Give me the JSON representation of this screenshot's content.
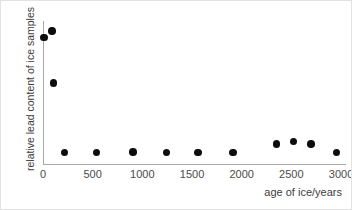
{
  "chart_data": {
    "type": "scatter",
    "title": "",
    "xlabel": "age of ice/years",
    "ylabel": "relative lead content of ice samples",
    "xlim": [
      0,
      3050
    ],
    "ylim": [
      0,
      1.05
    ],
    "grid": false,
    "legend": null,
    "xticks": [
      0,
      500,
      1000,
      1500,
      2000,
      2500,
      3000
    ],
    "xticklabels": [
      "0",
      "500",
      "1000",
      "1500",
      "2000",
      "2500",
      "3000"
    ],
    "yticks": [],
    "yticklabels": [],
    "x": [
      10,
      90,
      105,
      215,
      540,
      905,
      1245,
      1560,
      1915,
      2350,
      2520,
      2700,
      2955
    ],
    "y": [
      0.93,
      0.975,
      0.595,
      0.083,
      0.083,
      0.09,
      0.083,
      0.083,
      0.083,
      0.145,
      0.165,
      0.145,
      0.083
    ],
    "points": [
      {
        "x": 10,
        "y": 0.93
      },
      {
        "x": 90,
        "y": 0.975
      },
      {
        "x": 105,
        "y": 0.595
      },
      {
        "x": 215,
        "y": 0.083
      },
      {
        "x": 540,
        "y": 0.083
      },
      {
        "x": 905,
        "y": 0.09
      },
      {
        "x": 1245,
        "y": 0.083
      },
      {
        "x": 1560,
        "y": 0.083
      },
      {
        "x": 1915,
        "y": 0.083
      },
      {
        "x": 2350,
        "y": 0.145
      },
      {
        "x": 2520,
        "y": 0.165
      },
      {
        "x": 2700,
        "y": 0.145
      },
      {
        "x": 2955,
        "y": 0.083
      }
    ],
    "marker": {
      "shape": "circle",
      "color": "#0d0d0d",
      "size_px": 7.6
    },
    "axis_color": "#a8a8a8",
    "background_color": "#ffffff"
  }
}
